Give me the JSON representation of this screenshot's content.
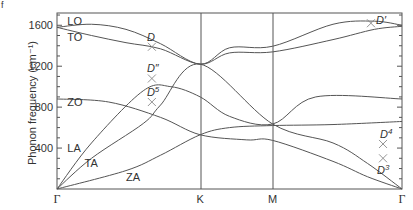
{
  "panel_label": "f",
  "chart_data": {
    "type": "line",
    "title": "",
    "xlabel": "",
    "ylabel": "Phonon frequency (cm-1)",
    "ylabel_display": "Phonon frequency (cm⁻¹)",
    "ylim": [
      0,
      1720
    ],
    "yticks": [
      400,
      800,
      1200,
      1600
    ],
    "ytick_labels": [
      "400",
      "800",
      "1200",
      "1600"
    ],
    "minor_ytick_step": 100,
    "x_points": [
      {
        "label": "Γ",
        "pos": 0.0
      },
      {
        "label": "K",
        "pos": 0.415
      },
      {
        "label": "M",
        "pos": 0.625
      },
      {
        "label": "Γ",
        "pos": 1.0
      }
    ],
    "branch_labels": [
      {
        "label": "LO",
        "x": 0.03,
        "y": 1640
      },
      {
        "label": "TO",
        "x": 0.03,
        "y": 1490
      },
      {
        "label": "ZO",
        "x": 0.03,
        "y": 850
      },
      {
        "label": "LA",
        "x": 0.03,
        "y": 400
      },
      {
        "label": "TA",
        "x": 0.08,
        "y": 250
      },
      {
        "label": "ZA",
        "x": 0.2,
        "y": 120
      }
    ],
    "series": [
      {
        "name": "LO",
        "points": [
          [
            0,
            1580
          ],
          [
            0.1,
            1610
          ],
          [
            0.2,
            1560
          ],
          [
            0.3,
            1420
          ],
          [
            0.415,
            1220
          ],
          [
            0.5,
            1380
          ],
          [
            0.625,
            1395
          ],
          [
            0.8,
            1610
          ],
          [
            0.92,
            1640
          ],
          [
            1.0,
            1600
          ]
        ]
      },
      {
        "name": "TO",
        "points": [
          [
            0,
            1580
          ],
          [
            0.1,
            1500
          ],
          [
            0.2,
            1430
          ],
          [
            0.3,
            1370
          ],
          [
            0.415,
            1220
          ],
          [
            0.5,
            1330
          ],
          [
            0.625,
            1340
          ],
          [
            0.8,
            1460
          ],
          [
            0.92,
            1560
          ],
          [
            1.0,
            1590
          ]
        ]
      },
      {
        "name": "ZO",
        "points": [
          [
            0,
            880
          ],
          [
            0.15,
            850
          ],
          [
            0.3,
            700
          ],
          [
            0.415,
            530
          ],
          [
            0.55,
            480
          ],
          [
            0.625,
            475
          ],
          [
            0.8,
            270
          ],
          [
            0.9,
            120
          ],
          [
            1.0,
            0
          ]
        ]
      },
      {
        "name": "LA",
        "points": [
          [
            0,
            0
          ],
          [
            0.1,
            450
          ],
          [
            0.25,
            960
          ],
          [
            0.33,
            1000
          ],
          [
            0.415,
            900
          ],
          [
            0.5,
            710
          ],
          [
            0.625,
            635
          ],
          [
            0.75,
            900
          ],
          [
            1.0,
            880
          ]
        ]
      },
      {
        "name": "TA",
        "points": [
          [
            0,
            0
          ],
          [
            0.1,
            300
          ],
          [
            0.25,
            640
          ],
          [
            0.3,
            820
          ],
          [
            0.415,
            1220
          ],
          [
            0.625,
            635
          ],
          [
            0.8,
            450
          ],
          [
            0.9,
            250
          ],
          [
            1.0,
            0
          ]
        ]
      },
      {
        "name": "ZA",
        "points": [
          [
            0,
            0
          ],
          [
            0.2,
            180
          ],
          [
            0.3,
            330
          ],
          [
            0.415,
            530
          ],
          [
            0.5,
            600
          ],
          [
            0.625,
            620
          ],
          [
            0.8,
            630
          ],
          [
            1.0,
            660
          ]
        ]
      }
    ],
    "raman_modes": [
      {
        "label": "D",
        "sup": "",
        "x": 0.275,
        "y": 1390
      },
      {
        "label": "D″",
        "sup": "",
        "x": 0.275,
        "y": 1080
      },
      {
        "label": "D",
        "sup": "5",
        "x": 0.275,
        "y": 850
      },
      {
        "label": "D′",
        "sup": "",
        "x": 0.91,
        "y": 1620
      },
      {
        "label": "D",
        "sup": "4",
        "x": 0.945,
        "y": 440
      },
      {
        "label": "D",
        "sup": "3",
        "x": 0.945,
        "y": 300
      }
    ],
    "grid": false,
    "legend": "none"
  }
}
